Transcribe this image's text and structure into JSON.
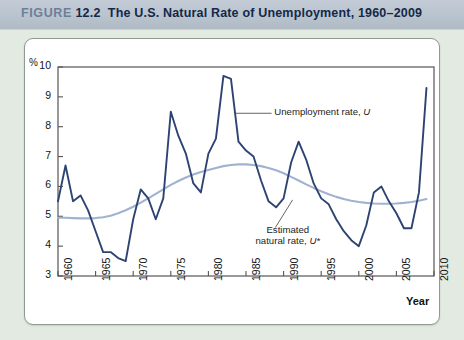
{
  "header": {
    "figure_word": "FIGURE",
    "figure_number": "12.2",
    "title": "The U.S. Natural Rate of Unemployment, 1960–2009"
  },
  "axis": {
    "y_unit": "%",
    "x_axis_label": "Year",
    "y_ticks": [
      "10",
      "9",
      "8",
      "7",
      "6",
      "5",
      "4",
      "3"
    ],
    "x_ticks": [
      "1960",
      "1965",
      "1970",
      "1975",
      "1980",
      "1985",
      "1990",
      "1995",
      "2000",
      "2005",
      "2010"
    ]
  },
  "annotations": {
    "unemployment": {
      "text": "Unemployment rate, ",
      "symbol": "U"
    },
    "natural": {
      "line1": "Estimated",
      "line2": "natural rate, ",
      "symbol": "U*"
    }
  },
  "colors": {
    "unemployment_line": "#2d4372",
    "natural_line": "#9fb3d1",
    "panel_bg": "#ffffff",
    "page_bg": "#e3eae2",
    "header_band": "#b9c3cd",
    "axis": "#555555"
  },
  "chart_data": {
    "type": "line",
    "title": "The U.S. Natural Rate of Unemployment, 1960–2009",
    "xlabel": "Year",
    "ylabel": "%",
    "xlim": [
      1960,
      2010
    ],
    "ylim": [
      3,
      10
    ],
    "grid": false,
    "legend": "annotations-inline",
    "x": [
      1960,
      1961,
      1962,
      1963,
      1964,
      1965,
      1966,
      1967,
      1968,
      1969,
      1970,
      1971,
      1972,
      1973,
      1974,
      1975,
      1976,
      1977,
      1978,
      1979,
      1980,
      1981,
      1982,
      1983,
      1984,
      1985,
      1986,
      1987,
      1988,
      1989,
      1990,
      1991,
      1992,
      1993,
      1994,
      1995,
      1996,
      1997,
      1998,
      1999,
      2000,
      2001,
      2002,
      2003,
      2004,
      2005,
      2006,
      2007,
      2008,
      2009
    ],
    "series": [
      {
        "name": "Unemployment rate, U",
        "color": "#2d4372",
        "values": [
          5.5,
          6.7,
          5.5,
          5.7,
          5.2,
          4.5,
          3.8,
          3.8,
          3.6,
          3.5,
          4.9,
          5.9,
          5.6,
          4.9,
          5.6,
          8.5,
          7.7,
          7.1,
          6.1,
          5.8,
          7.1,
          7.6,
          9.7,
          9.6,
          7.5,
          7.2,
          7.0,
          6.2,
          5.5,
          5.3,
          5.6,
          6.8,
          7.5,
          6.9,
          6.1,
          5.6,
          5.4,
          4.9,
          4.5,
          4.2,
          4.0,
          4.7,
          5.8,
          6.0,
          5.5,
          5.1,
          4.6,
          4.6,
          5.8,
          9.3
        ]
      },
      {
        "name": "Estimated natural rate, U*",
        "color": "#9fb3d1",
        "values": [
          4.95,
          4.95,
          4.94,
          4.93,
          4.93,
          4.94,
          4.97,
          5.02,
          5.1,
          5.2,
          5.32,
          5.46,
          5.6,
          5.75,
          5.9,
          6.05,
          6.18,
          6.3,
          6.4,
          6.48,
          6.55,
          6.62,
          6.68,
          6.72,
          6.74,
          6.74,
          6.72,
          6.68,
          6.62,
          6.54,
          6.44,
          6.32,
          6.2,
          6.07,
          5.95,
          5.84,
          5.74,
          5.65,
          5.58,
          5.52,
          5.48,
          5.45,
          5.43,
          5.42,
          5.42,
          5.43,
          5.45,
          5.48,
          5.52,
          5.58
        ]
      }
    ]
  }
}
